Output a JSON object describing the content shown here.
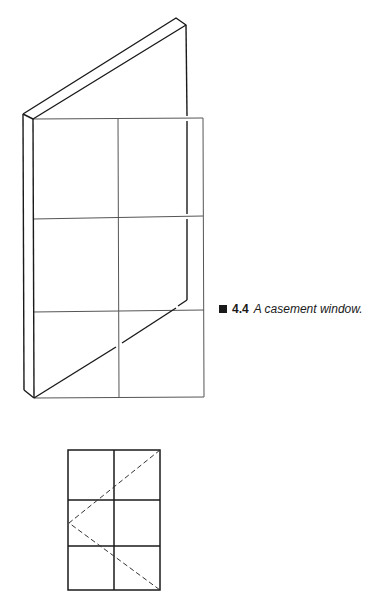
{
  "figure": {
    "caption": {
      "number": "4.4",
      "text": "A casement window."
    },
    "views": [
      {
        "name": "perspective-view",
        "description": "Casement window sash opened outward, shown in perspective in front of a 2x3 pane frame"
      },
      {
        "name": "elevation-view",
        "description": "Elevation with 2x3 panes and dashed hinge-side opening indicator"
      }
    ],
    "colors": {
      "line": "#1a1a1a",
      "grid": "#555555",
      "background": "#ffffff"
    }
  }
}
